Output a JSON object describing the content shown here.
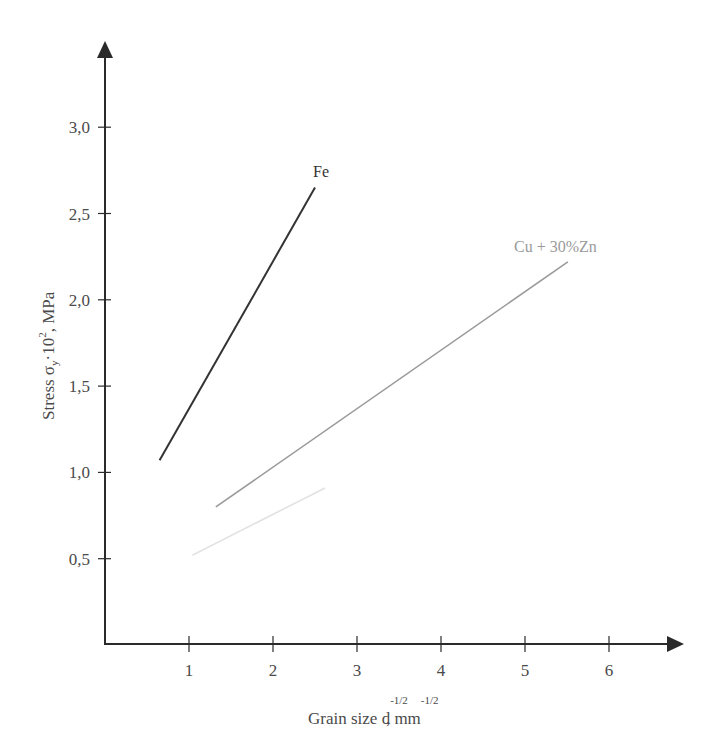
{
  "chart_data": {
    "type": "line",
    "title": "",
    "xlabel": "Grain size d^-1/2, mm^-1/2",
    "xlabel_parts": {
      "main": "Grain size d",
      "sup1": "-1/2",
      "mid": ",  mm",
      "sup2": "-1/2"
    },
    "ylabel": "Stress σy·10², MPa",
    "ylabel_parts": {
      "main": "Stress σ",
      "sub": "y",
      "mid": "·10",
      "sup": "2",
      "end": ", MPa"
    },
    "xlim": [
      0,
      6.8
    ],
    "ylim": [
      0,
      3.4
    ],
    "grid": false,
    "legend_position": "inline labels at line ends",
    "x_ticks": [
      1,
      2,
      3,
      4,
      5,
      6
    ],
    "x_tick_labels": [
      "1",
      "2",
      "3",
      "4",
      "5",
      "6"
    ],
    "y_ticks": [
      0.5,
      1.0,
      1.5,
      2.0,
      2.5,
      3.0
    ],
    "y_tick_labels": [
      "0,5",
      "1,0",
      "1,5",
      "2,0",
      "2,5",
      "3,0"
    ],
    "series": [
      {
        "name": "Fe",
        "color": "#333333",
        "x": [
          0.65,
          2.5
        ],
        "y": [
          1.07,
          2.65
        ]
      },
      {
        "name": "Cu + 30%Zn",
        "color": "#9a9a9a",
        "x": [
          1.32,
          5.51
        ],
        "y": [
          0.8,
          2.22
        ]
      },
      {
        "name": "",
        "color": "#e2e2e2",
        "x": [
          1.04,
          2.62
        ],
        "y": [
          0.52,
          0.91
        ]
      }
    ]
  }
}
